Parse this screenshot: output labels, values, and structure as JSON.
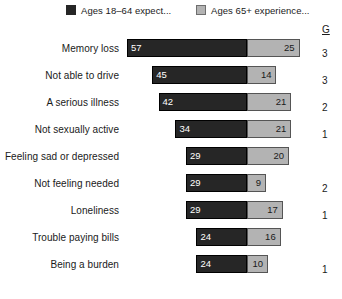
{
  "legend": {
    "entries": [
      {
        "label": "Ages 18–64 expect...",
        "color": "#262626",
        "swatch_icon": "filled-square-dark"
      },
      {
        "label": "Ages 65+ experience...",
        "color": "#b3b3b3",
        "swatch_icon": "filled-square-light"
      }
    ]
  },
  "side_column": {
    "header": "G",
    "values": [
      "3",
      "3",
      "2",
      "1",
      "",
      "2",
      "1",
      "",
      "1"
    ]
  },
  "chart_data": {
    "type": "bar",
    "orientation": "horizontal",
    "subtype": "diverging-stacked",
    "title": "",
    "xlabel": "",
    "ylabel": "",
    "grid": false,
    "legend_position": "top",
    "axis_center_value": 0,
    "categories": [
      "Memory loss",
      "Not able to drive",
      "A serious illness",
      "Not sexually active",
      "Feeling sad or depressed",
      "Not feeling needed",
      "Loneliness",
      "Trouble paying bills",
      "Being a burden"
    ],
    "series": [
      {
        "name": "Ages 18–64 expect...",
        "color": "#262626",
        "direction": "left",
        "values": [
          57,
          45,
          42,
          34,
          29,
          29,
          29,
          24,
          24
        ]
      },
      {
        "name": "Ages 65+ experience...",
        "color": "#b3b3b3",
        "direction": "right",
        "values": [
          25,
          14,
          21,
          21,
          20,
          9,
          17,
          16,
          10
        ]
      }
    ],
    "value_labels": {
      "left": [
        "57",
        "45",
        "42",
        "34",
        "29",
        "29",
        "29",
        "24",
        "24"
      ],
      "right": [
        "25",
        "14",
        "21",
        "21",
        "20",
        "9",
        "17",
        "16",
        "10"
      ]
    },
    "units": "percent",
    "xlim": [
      -60,
      30
    ]
  },
  "geometry": {
    "center_x_px": 247,
    "px_per_unit": 2.105,
    "row_height_px": 27,
    "bar_height_px": 18,
    "plot_top_px": 38
  }
}
